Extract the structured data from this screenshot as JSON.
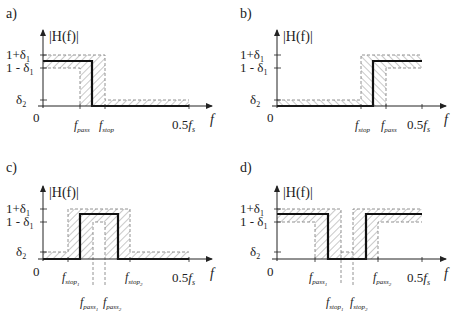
{
  "figure": {
    "y_axis_label": "|H(f)|",
    "x_axis_label": "f",
    "origin_label": "0",
    "y_ticks": [
      "1+δ1",
      "1 - δ1",
      "δ2"
    ],
    "panels": [
      {
        "id": "a",
        "label": "a)",
        "type": "lowpass",
        "x_ticks": [
          "f_pass",
          "f_stop",
          "0.5f_s"
        ]
      },
      {
        "id": "b",
        "label": "b)",
        "type": "highpass",
        "x_ticks": [
          "f_stop",
          "f_pass",
          "0.5f_s"
        ]
      },
      {
        "id": "c",
        "label": "c)",
        "type": "bandpass",
        "x_ticks": [
          "f_stop1",
          "f_pass1",
          "f_pass2",
          "f_stop2",
          "0.5f_s"
        ]
      },
      {
        "id": "d",
        "label": "d)",
        "type": "bandstop",
        "x_ticks": [
          "f_pass1",
          "f_stop1",
          "f_stop2",
          "f_pass2",
          "0.5f_s"
        ]
      }
    ]
  },
  "labels": {
    "a": "a)",
    "b": "b)",
    "c": "c)",
    "d": "d)",
    "H": "|H(f)|",
    "one_plus": "1+δ",
    "one_minus": "1 - δ",
    "delta": "δ",
    "sub1": "1",
    "sub2": "2",
    "zero": "0",
    "f": "f",
    "half": "0.5",
    "fs": "f",
    "s": "s",
    "pass": "pass",
    "stop": "stop"
  }
}
